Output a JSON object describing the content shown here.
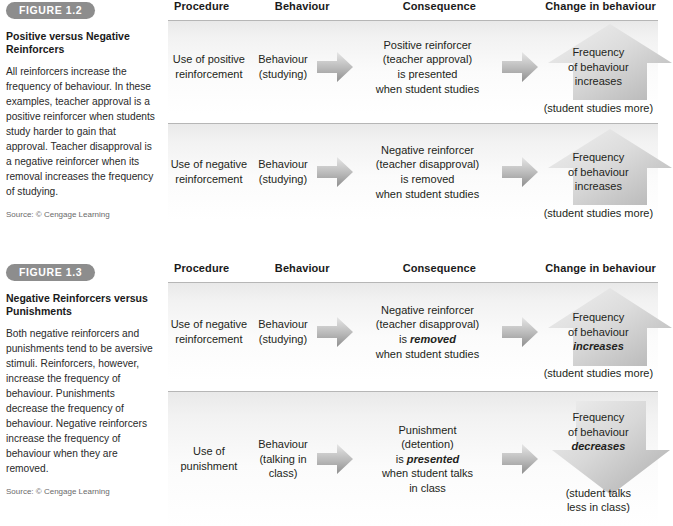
{
  "figures": [
    {
      "badge": "FIGURE 1.2",
      "title": "Positive versus Negative Reinforcers",
      "description": "All reinforcers increase the frequency of behaviour. In these examples, teacher approval is a positive reinforcer when students study harder to gain that approval. Teacher disapproval is a negative reinforcer when its removal increases the frequency of studying.",
      "source": "Source: © Cengage Learning",
      "headers": [
        "Procedure",
        "Behaviour",
        "Consequence",
        "Change in behaviour"
      ],
      "rows": [
        {
          "procedure": "Use of positive reinforcement",
          "behaviour": "Behaviour (studying)",
          "consequence_line1": "Positive reinforcer",
          "consequence_line2": "(teacher approval)",
          "consequence_line3": "is presented",
          "consequence_line4": "when student studies",
          "change_line1": "Frequency",
          "change_line2": "of behaviour",
          "change_line3": "increases",
          "change_note": "(student studies more)",
          "arrow_direction": "up"
        },
        {
          "procedure": "Use of negative reinforcement",
          "behaviour": "Behaviour (studying)",
          "consequence_line1": "Negative reinforcer",
          "consequence_line2": "(teacher disapproval)",
          "consequence_line3": "is removed",
          "consequence_line4": "when student studies",
          "change_line1": "Frequency",
          "change_line2": "of behaviour",
          "change_line3": "increases",
          "change_note": "(student studies more)",
          "arrow_direction": "up"
        }
      ]
    },
    {
      "badge": "FIGURE 1.3",
      "title": "Negative Reinforcers versus Punishments",
      "description": "Both negative reinforcers and punishments tend to be aversive stimuli. Reinforcers, however, increase the frequency of behaviour. Punishments decrease the frequency of behaviour. Negative reinforcers increase the frequency of behaviour when they are removed.",
      "source": "Source: © Cengage Learning",
      "headers": [
        "Procedure",
        "Behaviour",
        "Consequence",
        "Change in behaviour"
      ],
      "rows": [
        {
          "procedure": "Use of negative reinforcement",
          "behaviour": "Behaviour (studying)",
          "consequence_line1": "Negative reinforcer",
          "consequence_line2": "(teacher disapproval)",
          "consequence_line3_pre": "is ",
          "consequence_line3_em": "removed",
          "consequence_line4": "when student studies",
          "change_line1": "Frequency",
          "change_line2": "of behaviour",
          "change_line3_em": "increases",
          "change_note": "(student studies more)",
          "arrow_direction": "up"
        },
        {
          "procedure": "Use of punishment",
          "behaviour": "Behaviour (talking in class)",
          "consequence_line1": "Punishment",
          "consequence_line2": "(detention)",
          "consequence_line3_pre": "is ",
          "consequence_line3_em": "presented",
          "consequence_line4": "when student talks",
          "consequence_line5": "in class",
          "change_line1": "Frequency",
          "change_line2": "of behaviour",
          "change_line3_em": "decreases",
          "change_note_line1": "(student talks",
          "change_note_line2": "less in class)",
          "arrow_direction": "down"
        }
      ]
    }
  ],
  "colors": {
    "badge_gray": "#8d8d8d",
    "arrow_gray_light": "#e2e2e2",
    "arrow_gray_dark": "#9a9a9a",
    "rule_gray": "#b6b6b6"
  }
}
